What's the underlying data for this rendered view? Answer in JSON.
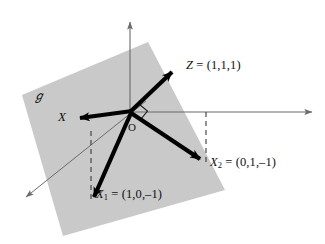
{
  "figure": {
    "type": "vector-diagram",
    "background_color": "#ffffff",
    "plane_fill_color": "#c9c9c9",
    "vector_color": "#000000",
    "axis_color": "#6b6b6b",
    "dash_color": "#3a3a3a"
  },
  "labels": {
    "plane": "ℊ",
    "origin": "O",
    "vector_x": "X",
    "vector_z": "Z = (1,1,1)",
    "vector_x1": "X",
    "vector_x1_sub": "1",
    "vector_x1_value": " = (1,0,–1)",
    "vector_x2": "X",
    "vector_x2_sub": "2",
    "vector_x2_value": " = (0,1,–1)",
    "vector_z_name": "Z",
    "vector_z_value": " = (1,1,1)"
  },
  "geometry": {
    "origin": {
      "x": 130,
      "y": 112
    },
    "plane_polygon": "148,42 225,190 63,236 22,95",
    "axes": [
      {
        "name": "vertical-axis",
        "x1": 130,
        "y1": 112,
        "x2": 130,
        "y2": 18
      },
      {
        "name": "horizontal-axis",
        "x1": 130,
        "y1": 112,
        "x2": 316,
        "y2": 112
      },
      {
        "name": "diagonal-axis",
        "x1": 146,
        "y1": 101,
        "x2": 22,
        "y2": 200
      }
    ],
    "vectors": [
      {
        "name": "Z",
        "x1": 130,
        "y1": 112,
        "x2": 177,
        "y2": 67
      },
      {
        "name": "X",
        "x1": 130,
        "y1": 112,
        "x2": 74,
        "y2": 119
      },
      {
        "name": "X1",
        "x1": 130,
        "y1": 112,
        "x2": 91,
        "y2": 204
      },
      {
        "name": "X2",
        "x1": 130,
        "y1": 112,
        "x2": 206,
        "y2": 164
      }
    ],
    "dashed_lines": [
      {
        "name": "projection-x2",
        "x1": 206,
        "y1": 112,
        "x2": 206,
        "y2": 164
      },
      {
        "name": "projection-x1",
        "x1": 91,
        "y1": 131,
        "x2": 91,
        "y2": 204
      }
    ],
    "right_angle_marker": {
      "x": 130,
      "y": 112,
      "size": 10
    }
  }
}
